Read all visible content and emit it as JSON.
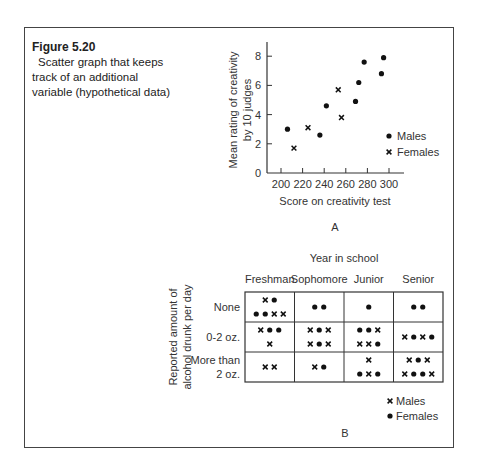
{
  "figure": {
    "label": "Figure 5.20",
    "caption": "Scatter graph that keeps track of an additional variable (hypothetical data)"
  },
  "chart_data": [
    {
      "type": "scatter",
      "panel": "A",
      "title": "",
      "xlabel": "Score on creativity test",
      "ylabel_line1": "Mean rating of creativity",
      "ylabel_line2": "by 10 judges",
      "xlim": [
        200,
        300
      ],
      "ylim": [
        0,
        9
      ],
      "xticks": [
        200,
        220,
        240,
        260,
        280,
        300
      ],
      "yticks": [
        0,
        2,
        4,
        6,
        8
      ],
      "grid": false,
      "legend": [
        {
          "marker": "dot",
          "label": "Males"
        },
        {
          "marker": "cross",
          "label": "Females"
        }
      ],
      "series": [
        {
          "name": "Males",
          "marker": "dot",
          "points": [
            [
              206,
              3.0
            ],
            [
              236,
              2.6
            ],
            [
              242,
              4.6
            ],
            [
              269,
              4.9
            ],
            [
              272,
              6.2
            ],
            [
              277,
              7.6
            ],
            [
              293,
              6.8
            ],
            [
              295,
              7.9
            ]
          ]
        },
        {
          "name": "Females",
          "marker": "cross",
          "points": [
            [
              212,
              1.7
            ],
            [
              225,
              3.1
            ],
            [
              253,
              5.7
            ],
            [
              256,
              3.8
            ]
          ]
        }
      ]
    },
    {
      "type": "table",
      "panel": "B",
      "title": "Year in school",
      "ylabel_line1": "Reported amount of",
      "ylabel_line2": "alcohol drunk per day",
      "columns": [
        "Freshman",
        "Sophomore",
        "Junior",
        "Senior"
      ],
      "rows": [
        "None",
        "0-2 oz.",
        "More than 2 oz."
      ],
      "row_label_lines": [
        [
          "None"
        ],
        [
          "0-2 oz."
        ],
        [
          "More than",
          "2 oz."
        ]
      ],
      "legend": [
        {
          "marker": "cross",
          "label": "Males"
        },
        {
          "marker": "dot",
          "label": "Females"
        }
      ],
      "cells": [
        [
          [
            [
              "x",
              "o"
            ],
            [
              "o",
              "o",
              "x",
              "x"
            ]
          ],
          [
            [
              "o",
              "o"
            ]
          ],
          [
            [
              "o"
            ]
          ],
          [
            [
              "o",
              "o"
            ]
          ]
        ],
        [
          [
            [
              "x",
              "o",
              "o"
            ],
            [
              "x"
            ]
          ],
          [
            [
              "x",
              "o",
              "x"
            ],
            [
              "x",
              "o",
              "x"
            ]
          ],
          [
            [
              "o",
              "o",
              "x"
            ],
            [
              "x",
              "x",
              "o"
            ]
          ],
          [
            [
              "x",
              "o",
              "x",
              "o"
            ]
          ]
        ],
        [
          [
            [
              "x",
              "x"
            ]
          ],
          [
            [
              "x",
              "o"
            ]
          ],
          [
            [
              "x"
            ],
            [
              "o",
              "x",
              "o"
            ]
          ],
          [
            [
              "x",
              "o",
              "x"
            ],
            [
              "x",
              "o",
              "o",
              "x"
            ]
          ]
        ]
      ]
    }
  ]
}
